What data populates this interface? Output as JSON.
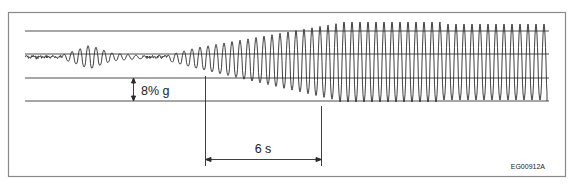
{
  "figure": {
    "id_label": "EG00912A",
    "amplitude_label": "8% g",
    "time_label": "6 s",
    "colors": {
      "frame": "#8a8a8a",
      "grid": "#3a3a3a",
      "trace": "#2a2a2a",
      "background": "#ffffff"
    }
  },
  "chart_data": {
    "type": "line",
    "title": "",
    "xlabel": "",
    "ylabel": "",
    "grid": true,
    "grid_lines_y": 4,
    "scale_annotations": [
      {
        "kind": "vertical",
        "label": "8% g",
        "spans": "one grid interval"
      },
      {
        "kind": "horizontal",
        "label": "6 s"
      }
    ],
    "envelope": [
      {
        "x0": 25,
        "x1": 62,
        "center": 57,
        "amp": 1.5,
        "noise": true
      },
      {
        "x0": 62,
        "x1": 90,
        "center": 57,
        "amp_from": 2,
        "amp_to": 12
      },
      {
        "x0": 90,
        "x1": 112,
        "center": 57,
        "amp_from": 12,
        "amp_to": 4
      },
      {
        "x0": 112,
        "x1": 140,
        "center": 57,
        "amp_from": 4,
        "amp_to": 1.5
      },
      {
        "x0": 140,
        "x1": 168,
        "center": 57,
        "amp": 1.5,
        "noise": true
      },
      {
        "x0": 168,
        "x1": 195,
        "center": 58,
        "amp_from": 3,
        "amp_to": 10
      },
      {
        "x0": 195,
        "x1": 340,
        "center_from": 58,
        "center_to": 62,
        "amp_from": 10,
        "amp_to": 39
      },
      {
        "x0": 340,
        "x1": 440,
        "center": 62,
        "amp": 40
      },
      {
        "x0": 440,
        "x1": 547,
        "center": 62,
        "amp": 38
      }
    ],
    "period_px": 8
  }
}
